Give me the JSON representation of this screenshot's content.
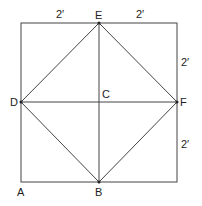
{
  "diagram": {
    "points": {
      "A": {
        "label": "A",
        "x": 21,
        "y": 182
      },
      "B": {
        "label": "B",
        "x": 99,
        "y": 182
      },
      "C": {
        "label": "C",
        "x": 99,
        "y": 102
      },
      "D": {
        "label": "D",
        "x": 21,
        "y": 102
      },
      "E": {
        "label": "E",
        "x": 99,
        "y": 23
      },
      "F": {
        "label": "F",
        "x": 177,
        "y": 102
      }
    },
    "dimensions": {
      "top_left": "2′",
      "top_right": "2′",
      "right_upper": "2′",
      "right_lower": "2′"
    },
    "colors": {
      "line": "#444444",
      "text": "#222222",
      "background": "#ffffff"
    }
  }
}
